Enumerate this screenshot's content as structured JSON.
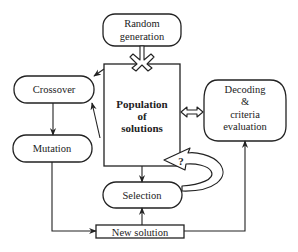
{
  "diagram": {
    "type": "genetic-algorithm-flowchart",
    "nodes": {
      "random_generation": {
        "lines": [
          "Random",
          "generation"
        ]
      },
      "population": {
        "lines": [
          "Population",
          "of",
          "solutions"
        ]
      },
      "crossover": {
        "label": "Crossover"
      },
      "mutation": {
        "label": "Mutation"
      },
      "decoding": {
        "lines": [
          "Decoding",
          "&",
          "criteria",
          "evaluation"
        ]
      },
      "selection": {
        "label": "Selection"
      },
      "new_solution": {
        "label": "New solution"
      }
    },
    "question_mark": "?",
    "edges": [
      {
        "from": "random_generation",
        "to": "population",
        "style": "hollow-fork-arrow"
      },
      {
        "from": "population",
        "to": "crossover"
      },
      {
        "from": "population",
        "to": "crossover",
        "note": "second arrow from lower left"
      },
      {
        "from": "crossover",
        "to": "mutation"
      },
      {
        "from": "mutation",
        "to": "new_solution"
      },
      {
        "from": "population",
        "to": "decoding",
        "style": "hollow-double-arrow"
      },
      {
        "from": "population",
        "to": "selection"
      },
      {
        "from": "selection",
        "to": "population",
        "style": "hollow-curved-arrow",
        "label": "?"
      },
      {
        "from": "new_solution",
        "to": "selection"
      },
      {
        "from": "new_solution",
        "to": "decoding"
      }
    ],
    "colors": {
      "stroke": "#222222",
      "background": "#ffffff"
    }
  }
}
